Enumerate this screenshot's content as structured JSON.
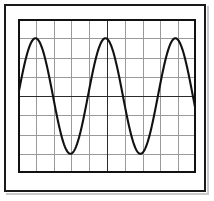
{
  "figure": {
    "name": "oscilloscope-graticule",
    "background_color": "#ffffff",
    "frame_color": "#1a1a1a",
    "shadow_color": "#c9c9c9"
  },
  "chart_data": {
    "type": "line",
    "title": "",
    "subtitle": "",
    "xlabel": "",
    "ylabel": "",
    "legend": [],
    "annotations": [],
    "grid": true,
    "grid_color": "#9a9a9a",
    "axis_color": "#2b2b2b",
    "border_color": "#111111",
    "trace_color": "#111111",
    "x_divisions": 10,
    "y_divisions": 8,
    "xlim": [
      0,
      10
    ],
    "ylim": [
      -4,
      4
    ],
    "xticks": [
      0,
      1,
      2,
      3,
      4,
      5,
      6,
      7,
      8,
      9,
      10
    ],
    "yticks": [
      -4,
      -3,
      -2,
      -1,
      0,
      1,
      2,
      3,
      4
    ],
    "xticklabels": [],
    "yticklabels": [],
    "center_axis_x": 5,
    "center_axis_y": 0,
    "series": [
      {
        "name": "sine-wave",
        "waveform": "sine",
        "amplitude_divisions": 3,
        "period_divisions": 3.93,
        "cycles_visible": 2.54,
        "phase_offset_divisions": 0,
        "starts_at": "zero-crossing-rising",
        "peaks_x": [
          1.07,
          5.0,
          8.93
        ],
        "peaks_y": [
          3,
          3,
          3
        ],
        "troughs_x": [
          3.03,
          6.97
        ],
        "troughs_y": [
          -3,
          -3
        ],
        "zero_crossings_x": [
          0,
          2.05,
          4.0,
          5.96,
          7.91,
          9.87
        ],
        "x": [
          0,
          0.25,
          0.5,
          0.75,
          1,
          1.25,
          1.5,
          1.75,
          2,
          2.25,
          2.5,
          2.75,
          3,
          3.25,
          3.5,
          3.75,
          4,
          4.25,
          4.5,
          4.75,
          5,
          5.25,
          5.5,
          5.75,
          6,
          6.25,
          6.5,
          6.75,
          7,
          7.25,
          7.5,
          7.75,
          8,
          8.25,
          8.5,
          8.75,
          9,
          9.25,
          9.5,
          9.75,
          10
        ],
        "values": [
          0,
          1.14,
          2.09,
          2.72,
          2.99,
          2.83,
          2.29,
          1.43,
          0.39,
          -0.71,
          -1.75,
          -2.52,
          -2.94,
          -2.95,
          -2.55,
          -1.8,
          -0.8,
          0.32,
          1.39,
          2.3,
          2.88,
          3.0,
          2.68,
          1.97,
          0.98,
          -0.16,
          -1.28,
          -2.21,
          -2.81,
          -2.99,
          -2.74,
          -2.09,
          -1.14,
          0.0,
          1.14,
          2.09,
          2.74,
          2.99,
          2.81,
          2.21,
          1.28
        ]
      }
    ]
  }
}
